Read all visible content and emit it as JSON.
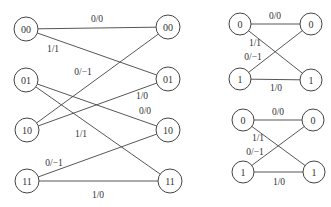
{
  "diagrams": [
    {
      "id": "two-bit-trellis",
      "node_radius": 12,
      "nodes": [
        {
          "id": "L00",
          "label": "00",
          "x": 26,
          "y": 29
        },
        {
          "id": "L01",
          "label": "01",
          "x": 26,
          "y": 80
        },
        {
          "id": "L10",
          "label": "10",
          "x": 27,
          "y": 130
        },
        {
          "id": "L11",
          "label": "11",
          "x": 27,
          "y": 181
        },
        {
          "id": "R00",
          "label": "00",
          "x": 168,
          "y": 27
        },
        {
          "id": "R01",
          "label": "01",
          "x": 168,
          "y": 79
        },
        {
          "id": "R10",
          "label": "10",
          "x": 168,
          "y": 130
        },
        {
          "id": "R11",
          "label": "11",
          "x": 170,
          "y": 181
        }
      ],
      "edges": [
        {
          "from": "L00",
          "to": "R00",
          "label": "0/0",
          "lx": 97,
          "ly": 22
        },
        {
          "from": "L00",
          "to": "R01",
          "label": "1/1",
          "lx": 53,
          "ly": 52
        },
        {
          "from": "L01",
          "to": "R10",
          "label": "0/0",
          "lx": 145,
          "ly": 114
        },
        {
          "from": "L01",
          "to": "R11",
          "label": "1/1",
          "lx": 81,
          "ly": 137
        },
        {
          "from": "L10",
          "to": "R00",
          "label": "0/−1",
          "lx": 83,
          "ly": 75
        },
        {
          "from": "L10",
          "to": "R01",
          "label": "1/0",
          "lx": 142,
          "ly": 99
        },
        {
          "from": "L11",
          "to": "R10",
          "label": "0/−1",
          "lx": 54,
          "ly": 166
        },
        {
          "from": "L11",
          "to": "R11",
          "label": "1/0",
          "lx": 98,
          "ly": 198
        }
      ]
    },
    {
      "id": "one-bit-trellis-top",
      "node_radius": 11,
      "nodes": [
        {
          "id": "A0",
          "label": "0",
          "x": 240,
          "y": 24
        },
        {
          "id": "A1",
          "label": "1",
          "x": 240,
          "y": 79
        },
        {
          "id": "B0",
          "label": "0",
          "x": 311,
          "y": 24
        },
        {
          "id": "B1",
          "label": "1",
          "x": 311,
          "y": 80
        }
      ],
      "edges": [
        {
          "from": "A0",
          "to": "B0",
          "label": "0/0",
          "lx": 275,
          "ly": 19
        },
        {
          "from": "A0",
          "to": "B1",
          "label": "1/1",
          "lx": 255,
          "ly": 46
        },
        {
          "from": "A1",
          "to": "B0",
          "label": "0/−1",
          "lx": 253,
          "ly": 60
        },
        {
          "from": "A1",
          "to": "B1",
          "label": "1/0",
          "lx": 276,
          "ly": 91
        }
      ]
    },
    {
      "id": "one-bit-trellis-bottom",
      "node_radius": 11,
      "nodes": [
        {
          "id": "C0",
          "label": "0",
          "x": 243,
          "y": 120
        },
        {
          "id": "C1",
          "label": "1",
          "x": 243,
          "y": 172
        },
        {
          "id": "D0",
          "label": "0",
          "x": 313,
          "y": 120
        },
        {
          "id": "D1",
          "label": "1",
          "x": 314,
          "y": 172
        }
      ],
      "edges": [
        {
          "from": "C0",
          "to": "D0",
          "label": "0/0",
          "lx": 278,
          "ly": 115
        },
        {
          "from": "C0",
          "to": "D1",
          "label": "1/1",
          "lx": 258,
          "ly": 141
        },
        {
          "from": "C1",
          "to": "D0",
          "label": "0/−1",
          "lx": 255,
          "ly": 155
        },
        {
          "from": "C1",
          "to": "D1",
          "label": "1/0",
          "lx": 279,
          "ly": 185
        }
      ]
    }
  ]
}
